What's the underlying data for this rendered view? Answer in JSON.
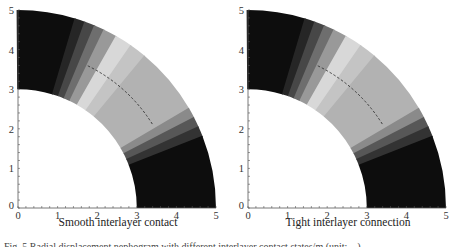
{
  "figure": {
    "caption": "Fig. 5  Radial displacement nephogram with different interlayer contact states/m (unit: ...)"
  },
  "panels": [
    {
      "id": "left",
      "xlabel": "Smooth interlayer contact"
    },
    {
      "id": "right",
      "xlabel": "Tight interlayer connection"
    }
  ],
  "axes": {
    "x_ticks": [
      "0",
      "1",
      "2",
      "3",
      "4",
      "5"
    ],
    "y_ticks": [
      "0",
      "1",
      "2",
      "3",
      "4",
      "5"
    ]
  },
  "colors": {
    "band_black": "#0d0d0d",
    "band_lightest": "#d8d8d8",
    "band_mid": "#b2b2b2",
    "dashed_line": "#333333"
  },
  "chart_data": [
    {
      "type": "heatmap",
      "title": "Smooth interlayer contact",
      "xlabel": "Smooth interlayer contact",
      "ylabel": "",
      "xlim": [
        0,
        5
      ],
      "ylim": [
        0,
        5
      ],
      "x_ticks": [
        0,
        1,
        2,
        3,
        4,
        5
      ],
      "y_ticks": [
        0,
        1,
        2,
        3,
        4,
        5
      ],
      "geometry": "quarter annulus, inner radius 3, outer radius 5",
      "inner_radius": 3,
      "outer_radius": 5,
      "dashed_arc": {
        "radius": 4,
        "angle_start_deg": 32,
        "angle_end_deg": 64
      },
      "bands_by_angle_deg": [
        {
          "from": 73,
          "to": 90,
          "shade": "#0d0d0d"
        },
        {
          "from": 70,
          "to": 73,
          "shade": "#262626"
        },
        {
          "from": 67,
          "to": 70,
          "shade": "#474747"
        },
        {
          "from": 64,
          "to": 67,
          "shade": "#6e6e6e"
        },
        {
          "from": 60,
          "to": 64,
          "shade": "#999999"
        },
        {
          "from": 55,
          "to": 60,
          "shade": "#d8d8d8"
        },
        {
          "from": 50,
          "to": 55,
          "shade": "#c4c4c4"
        },
        {
          "from": 30,
          "to": 50,
          "shade": "#b2b2b2"
        },
        {
          "from": 27,
          "to": 30,
          "shade": "#8a8a8a"
        },
        {
          "from": 24,
          "to": 27,
          "shade": "#575757"
        },
        {
          "from": 21,
          "to": 24,
          "shade": "#333333"
        },
        {
          "from": 0,
          "to": 21,
          "shade": "#0d0d0d"
        }
      ]
    },
    {
      "type": "heatmap",
      "title": "Tight interlayer connection",
      "xlabel": "Tight interlayer connection",
      "ylabel": "",
      "xlim": [
        0,
        5
      ],
      "ylim": [
        0,
        5
      ],
      "x_ticks": [
        0,
        1,
        2,
        3,
        4,
        5
      ],
      "y_ticks": [
        0,
        1,
        2,
        3,
        4,
        5
      ],
      "geometry": "quarter annulus, inner radius 3, outer radius 5",
      "inner_radius": 3,
      "outer_radius": 5,
      "dashed_arc": {
        "radius": 4,
        "angle_start_deg": 32,
        "angle_end_deg": 64
      },
      "bands_by_angle_deg": [
        {
          "from": 73,
          "to": 90,
          "shade": "#0d0d0d"
        },
        {
          "from": 70,
          "to": 73,
          "shade": "#262626"
        },
        {
          "from": 67,
          "to": 70,
          "shade": "#474747"
        },
        {
          "from": 64,
          "to": 67,
          "shade": "#6e6e6e"
        },
        {
          "from": 60,
          "to": 64,
          "shade": "#999999"
        },
        {
          "from": 55,
          "to": 60,
          "shade": "#d8d8d8"
        },
        {
          "from": 50,
          "to": 55,
          "shade": "#c4c4c4"
        },
        {
          "from": 30,
          "to": 50,
          "shade": "#b2b2b2"
        },
        {
          "from": 27,
          "to": 30,
          "shade": "#8a8a8a"
        },
        {
          "from": 24,
          "to": 27,
          "shade": "#575757"
        },
        {
          "from": 21,
          "to": 24,
          "shade": "#333333"
        },
        {
          "from": 0,
          "to": 21,
          "shade": "#0d0d0d"
        }
      ]
    }
  ]
}
